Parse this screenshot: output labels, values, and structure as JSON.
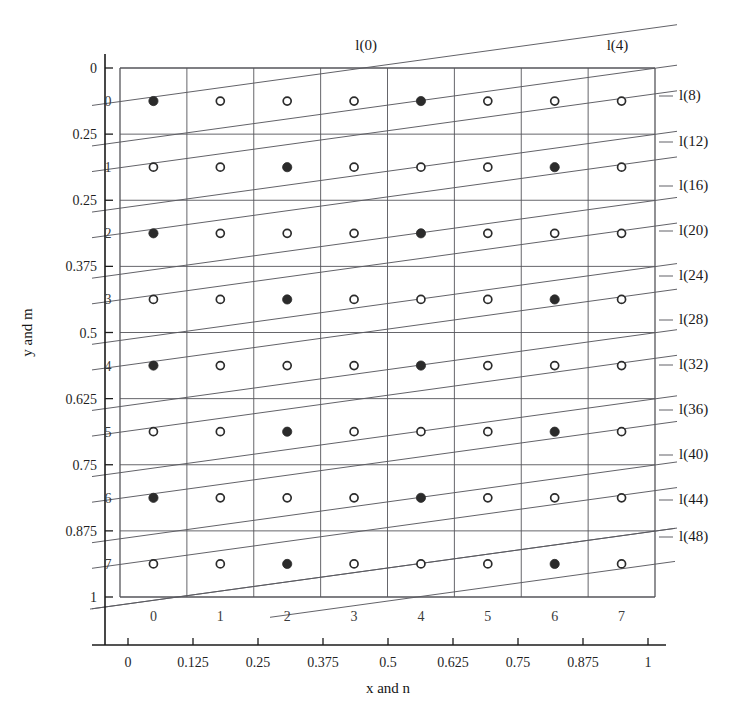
{
  "figure": {
    "axis_titles": {
      "x": "x and n",
      "y": "y and m"
    },
    "x_axis": {
      "tick_labels": [
        "0",
        "0.125",
        "0.25",
        "0.375",
        "0.5",
        "0.625",
        "0.75",
        "0.875",
        "1"
      ],
      "tick_values": [
        0,
        0.125,
        0.25,
        0.375,
        0.5,
        0.625,
        0.75,
        0.875,
        1
      ],
      "cell_indices": [
        "0",
        "1",
        "2",
        "3",
        "4",
        "5",
        "6",
        "7"
      ]
    },
    "y_axis": {
      "tick_labels": [
        "0",
        "0.25",
        "0.25",
        "0.375",
        "0.5",
        "0.625",
        "0.75",
        "0.875",
        "1"
      ],
      "tick_values": [
        0,
        0.125,
        0.25,
        0.375,
        0.5,
        0.625,
        0.75,
        0.875,
        1
      ],
      "cell_indices": [
        "0",
        "1",
        "2",
        "3",
        "4",
        "5",
        "6",
        "7"
      ]
    },
    "top_labels": [
      {
        "text": "l(0)",
        "x_frac": 0.46
      },
      {
        "text": "l(4)",
        "x_frac": 0.93
      }
    ],
    "right_labels": [
      {
        "text": "l(8)",
        "y": 100
      },
      {
        "text": "l(12)",
        "y": 146
      },
      {
        "text": "l(16)",
        "y": 190
      },
      {
        "text": "l(20)",
        "y": 235
      },
      {
        "text": "l(24)",
        "y": 280
      },
      {
        "text": "l(28)",
        "y": 324
      },
      {
        "text": "l(32)",
        "y": 369
      },
      {
        "text": "l(36)",
        "y": 414
      },
      {
        "text": "l(40)",
        "y": 459
      },
      {
        "text": "l(44)",
        "y": 504
      },
      {
        "text": "l(48)",
        "y": 541
      }
    ],
    "grid": {
      "rows": 8,
      "cols": 8,
      "filled_even_rows": [
        0,
        4
      ],
      "filled_odd_rows": [
        2,
        6
      ]
    },
    "colors": {
      "ink": "#1b1b1b",
      "grid": "#55555a",
      "diagonal": "#5a5a60",
      "dot_filled": "#2b2b2b",
      "dot_open_stroke": "#2b2b2b",
      "dot_open_fill": "#ffffff",
      "background": "#ffffff"
    }
  }
}
